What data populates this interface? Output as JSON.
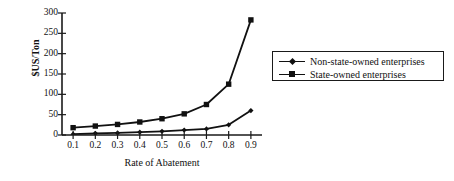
{
  "chart_data": {
    "type": "line",
    "title": "",
    "xlabel": "Rate of Abatement",
    "ylabel": "$US/Ton",
    "x": [
      0.1,
      0.2,
      0.3,
      0.4,
      0.5,
      0.6,
      0.7,
      0.8,
      0.9
    ],
    "xtick_labels": [
      "0.1",
      "0.2",
      "0.3",
      "0.4",
      "0.5",
      "0.6",
      "0.7",
      "0.8",
      "0.9"
    ],
    "ytick_labels": [
      "0",
      "50",
      "100",
      "150",
      "200",
      "250",
      "300"
    ],
    "yticks": [
      0,
      50,
      100,
      150,
      200,
      250,
      300
    ],
    "ylim": [
      0,
      300
    ],
    "xlim": [
      0.05,
      0.95
    ],
    "grid": false,
    "legend_position": "right",
    "series": [
      {
        "name": "Non-state-owned enterprises",
        "marker": "diamond",
        "color": "#111111",
        "values": [
          2,
          4,
          5,
          7,
          9,
          12,
          15,
          25,
          60
        ]
      },
      {
        "name": "State-owned enterprises",
        "marker": "square",
        "color": "#111111",
        "values": [
          18,
          22,
          26,
          32,
          40,
          52,
          75,
          125,
          283
        ]
      }
    ]
  },
  "legend": {
    "entries": [
      {
        "label": "Non-state-owned enterprises",
        "marker": "diamond"
      },
      {
        "label": "State-owned enterprises",
        "marker": "square"
      }
    ]
  },
  "axes": {
    "x_title": "Rate of Abatement",
    "y_title": "$US/Ton"
  }
}
